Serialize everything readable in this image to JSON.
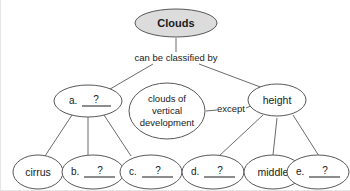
{
  "diagram": {
    "type": "concept-map",
    "title_node": "Clouds",
    "colors": {
      "root_fill": "#dcdcdc",
      "node_fill": "#ffffff",
      "stroke": "#58585a",
      "text": "#1a1a1a",
      "background": "#ffffff"
    },
    "nodes": {
      "root": {
        "label": "Clouds"
      },
      "branch_left": {
        "letter": "a.",
        "blank": "?"
      },
      "branch_middle": {
        "line1": "clouds of",
        "line2": "vertical",
        "line3": "development"
      },
      "branch_right": {
        "label": "height"
      },
      "leaf_1": {
        "label": "cirrus"
      },
      "leaf_2": {
        "letter": "b.",
        "blank": "?"
      },
      "leaf_3": {
        "letter": "c.",
        "blank": "?"
      },
      "leaf_4": {
        "letter": "d.",
        "blank": "?"
      },
      "leaf_5": {
        "label": "middle"
      },
      "leaf_6": {
        "letter": "e.",
        "blank": "?"
      }
    },
    "edge_labels": {
      "classified_by": "can be classified by",
      "except": "except"
    }
  }
}
